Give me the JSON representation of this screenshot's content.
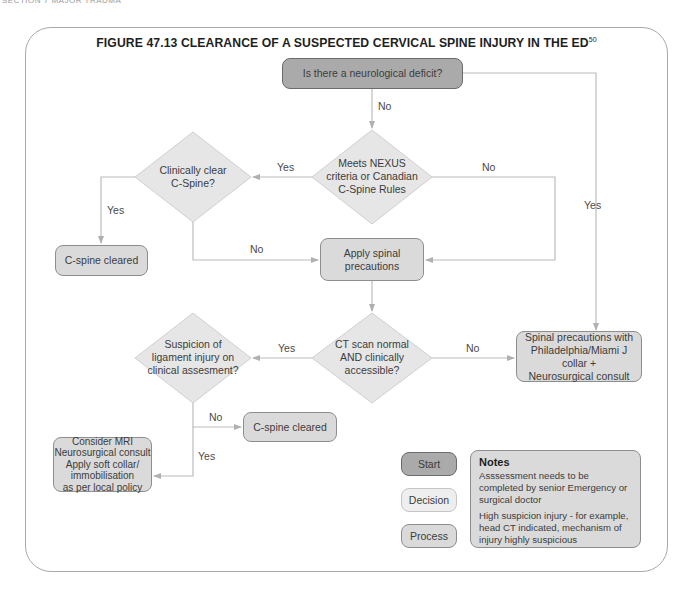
{
  "page_header": "SECTION 7 MAJOR TRAUMA",
  "figure": {
    "title": "FIGURE 47.13 CLEARANCE OF A SUSPECTED CERVICAL SPINE INJURY IN THE ED",
    "title_superscript": "50"
  },
  "nodes": {
    "neuro_deficit": "Is there a neurological deficit?",
    "nexus": [
      "Meets NEXUS",
      "criteria or Canadian",
      "C-Spine Rules"
    ],
    "clinically_clear": [
      "Clinically clear",
      "C-Spine?"
    ],
    "cspine_cleared_1": "C-spine cleared",
    "apply_precautions": [
      "Apply spinal",
      "precautions"
    ],
    "ct_scan": [
      "CT scan normal",
      "AND clinically",
      "accessible?"
    ],
    "suspicion": [
      "Suspicion of",
      "ligament injury on",
      "clinical assesment?"
    ],
    "spinal_precautions_collar": [
      "Spinal precautions with",
      "Philadelphia/Miami J collar +",
      "Neurosurgical consult"
    ],
    "cspine_cleared_2": "C-spine cleared",
    "consider_mri": [
      "Consider MRI",
      "Neurosurgical consult",
      "Apply soft collar/",
      "immobilisation",
      "as per local policy"
    ]
  },
  "edge_labels": {
    "neuro_no": "No",
    "neuro_yes": "Yes",
    "nexus_yes": "Yes",
    "nexus_no": "No",
    "clear_yes": "Yes",
    "clear_no": "No",
    "ct_yes": "Yes",
    "ct_no": "No",
    "suspicion_no": "No",
    "suspicion_yes": "Yes"
  },
  "legend": {
    "start": "Start",
    "decision": "Decision",
    "process": "Process"
  },
  "notes": {
    "title": "Notes",
    "items": [
      "Asssessment needs to be completed by senior Emergency or surgical doctor",
      "High suspicion injury - for example, head CT indicated, mechanism of injury highly suspicious"
    ]
  },
  "colors": {
    "start_fill": "#aaaaaa",
    "process_fill": "#dadada",
    "decision_fill": "#e6e6e6",
    "connector": "#b8b8b8",
    "frame_border": "#a9a9a9"
  }
}
